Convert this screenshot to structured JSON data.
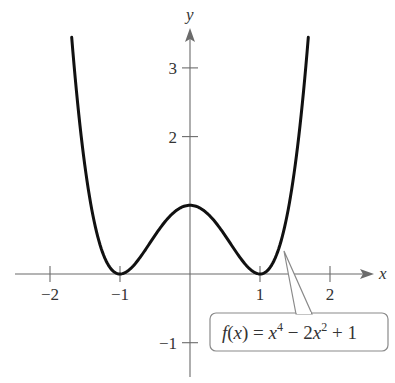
{
  "chart_data": {
    "type": "line",
    "title": "",
    "function_label": "f(x) = x^4 - 2x^2 + 1",
    "label_parts": {
      "f": "f",
      "open": "(",
      "x": "x",
      "close_eq": ") = ",
      "x1": "x",
      "exp1": "4",
      "minus": " − 2",
      "x2": "x",
      "exp2": "2",
      "plus": " + 1"
    },
    "xlabel": "x",
    "ylabel": "y",
    "xlim": [
      -2.5,
      2.6
    ],
    "ylim": [
      -1.5,
      3.6
    ],
    "x_ticks": [
      -2,
      -1,
      1,
      2
    ],
    "x_tick_labels": [
      "−2",
      "−1",
      "1",
      "2"
    ],
    "y_ticks": [
      -1,
      2,
      3
    ],
    "y_tick_labels": [
      "−1",
      "2",
      "3"
    ],
    "grid": false,
    "series": [
      {
        "name": "f(x) = x^4 - 2x^2 + 1",
        "x_range": [
          -1.69,
          1.69
        ],
        "points": [
          [
            -1.69,
            3.44
          ],
          [
            -1.5,
            1.5625
          ],
          [
            -1.25,
            0.3164
          ],
          [
            -1.0,
            0.0
          ],
          [
            -0.75,
            0.1914
          ],
          [
            -0.5,
            0.5625
          ],
          [
            -0.25,
            0.8789
          ],
          [
            0.0,
            1.0
          ],
          [
            0.25,
            0.8789
          ],
          [
            0.5,
            0.5625
          ],
          [
            0.75,
            0.1914
          ],
          [
            1.0,
            0.0
          ],
          [
            1.25,
            0.3164
          ],
          [
            1.5,
            1.5625
          ],
          [
            1.69,
            3.44
          ]
        ]
      }
    ],
    "key_points": {
      "local_max": [
        0,
        1
      ],
      "minima": [
        [
          -1,
          0
        ],
        [
          1,
          0
        ]
      ]
    },
    "annotations": [
      {
        "text": "f(x) = x^4 - 2x^2 + 1",
        "points_to": [
          1.35,
          0.5
        ],
        "style": "callout box"
      }
    ]
  }
}
